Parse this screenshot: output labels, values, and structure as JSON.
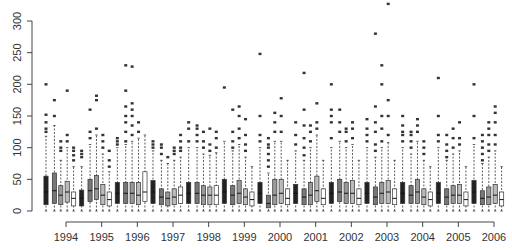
{
  "chart_data": {
    "type": "box",
    "title": "",
    "xlabel": "",
    "ylabel": "",
    "ylim": [
      0,
      330
    ],
    "yticks": [
      0,
      50,
      100,
      150,
      200,
      250,
      300
    ],
    "categories": [
      "1994",
      "1995",
      "1996",
      "1997",
      "1998",
      "1999",
      "2000",
      "2001",
      "2002",
      "2003",
      "2004",
      "2005",
      "2006"
    ],
    "boxes_per_category": 5,
    "groups": [
      {
        "year": "1994",
        "boxes": [
          {
            "q1": 10,
            "median": 30,
            "q3": 55,
            "whisker_low": 0,
            "whisker_high": 118,
            "fill": "#222",
            "outliers": [
              125,
              130,
              140,
              152,
              200
            ]
          },
          {
            "q1": 12,
            "median": 32,
            "q3": 60,
            "whisker_low": 0,
            "whisker_high": 135,
            "fill": "#777",
            "outliers": [
              150,
              175
            ]
          },
          {
            "q1": 10,
            "median": 25,
            "q3": 40,
            "whisker_low": 0,
            "whisker_high": 80,
            "fill": "#999",
            "outliers": [
              95,
              100,
              110
            ]
          },
          {
            "q1": 14,
            "median": 30,
            "q3": 47,
            "whisker_low": 0,
            "whisker_high": 100,
            "fill": "#bbb",
            "outliers": [
              110,
              120,
              190
            ]
          },
          {
            "q1": 8,
            "median": 20,
            "q3": 30,
            "whisker_low": 0,
            "whisker_high": 70,
            "fill": "#fff",
            "outliers": [
              80,
              88,
              95,
              100
            ]
          }
        ]
      },
      {
        "year": "1995",
        "boxes": [
          {
            "q1": 8,
            "median": 20,
            "q3": 33,
            "whisker_low": 0,
            "whisker_high": 70,
            "fill": "#222",
            "outliers": [
              85,
              90,
              95
            ]
          },
          {
            "q1": 15,
            "median": 32,
            "q3": 50,
            "whisker_low": 0,
            "whisker_high": 105,
            "fill": "#777",
            "outliers": [
              115,
              125,
              160
            ]
          },
          {
            "q1": 18,
            "median": 35,
            "q3": 56,
            "whisker_low": 0,
            "whisker_high": 120,
            "fill": "#999",
            "outliers": [
              130,
              175,
              182
            ]
          },
          {
            "q1": 10,
            "median": 25,
            "q3": 42,
            "whisker_low": 0,
            "whisker_high": 90,
            "fill": "#bbb",
            "outliers": [
              100,
              110,
              120
            ]
          },
          {
            "q1": 8,
            "median": 18,
            "q3": 30,
            "whisker_low": 0,
            "whisker_high": 62,
            "fill": "#fff",
            "outliers": [
              70,
              80,
              95
            ]
          }
        ]
      },
      {
        "year": "1996",
        "boxes": [
          {
            "q1": 12,
            "median": 28,
            "q3": 45,
            "whisker_low": 0,
            "whisker_high": 100,
            "fill": "#222",
            "outliers": [
              105,
              110,
              115
            ]
          },
          {
            "q1": 12,
            "median": 28,
            "q3": 45,
            "whisker_low": 0,
            "whisker_high": 105,
            "fill": "#777",
            "outliers": [
              110,
              125,
              140,
              150,
              165,
              190,
              230
            ]
          },
          {
            "q1": 12,
            "median": 28,
            "q3": 45,
            "whisker_low": 0,
            "whisker_high": 110,
            "fill": "#999",
            "outliers": [
              120,
              135,
              150,
              160,
              170,
              228
            ]
          },
          {
            "q1": 10,
            "median": 25,
            "q3": 45,
            "whisker_low": 0,
            "whisker_high": 115,
            "fill": "#bbb",
            "outliers": [
              125,
              140
            ]
          },
          {
            "q1": 15,
            "median": 30,
            "q3": 62,
            "whisker_low": 0,
            "whisker_high": 120,
            "fill": "#fff",
            "outliers": []
          }
        ]
      },
      {
        "year": "1997",
        "boxes": [
          {
            "q1": 12,
            "median": 30,
            "q3": 48,
            "whisker_low": 0,
            "whisker_high": 95,
            "fill": "#222",
            "outliers": [
              100,
              105,
              110
            ]
          },
          {
            "q1": 10,
            "median": 22,
            "q3": 35,
            "whisker_low": 0,
            "whisker_high": 80,
            "fill": "#777",
            "outliers": [
              90,
              100,
              105
            ]
          },
          {
            "q1": 8,
            "median": 20,
            "q3": 30,
            "whisker_low": 0,
            "whisker_high": 75,
            "fill": "#999",
            "outliers": [
              85
            ]
          },
          {
            "q1": 10,
            "median": 22,
            "q3": 35,
            "whisker_low": 0,
            "whisker_high": 80,
            "fill": "#bbb",
            "outliers": [
              90,
              95,
              100
            ]
          },
          {
            "q1": 12,
            "median": 25,
            "q3": 38,
            "whisker_low": 0,
            "whisker_high": 85,
            "fill": "#fff",
            "outliers": [
              95,
              100,
              110,
              120
            ]
          }
        ]
      },
      {
        "year": "1998",
        "boxes": [
          {
            "q1": 12,
            "median": 28,
            "q3": 45,
            "whisker_low": 0,
            "whisker_high": 100,
            "fill": "#222",
            "outliers": [
              110,
              130,
              140
            ]
          },
          {
            "q1": 12,
            "median": 28,
            "q3": 45,
            "whisker_low": 0,
            "whisker_high": 100,
            "fill": "#777",
            "outliers": [
              110,
              120,
              130,
              135
            ]
          },
          {
            "q1": 10,
            "median": 25,
            "q3": 40,
            "whisker_low": 0,
            "whisker_high": 90,
            "fill": "#999",
            "outliers": [
              100,
              110,
              125
            ]
          },
          {
            "q1": 10,
            "median": 25,
            "q3": 38,
            "whisker_low": 0,
            "whisker_high": 88,
            "fill": "#bbb",
            "outliers": [
              95,
              105,
              130
            ]
          },
          {
            "q1": 10,
            "median": 25,
            "q3": 40,
            "whisker_low": 0,
            "whisker_high": 92,
            "fill": "#fff",
            "outliers": [
              100,
              115,
              125
            ]
          }
        ]
      },
      {
        "year": "1999",
        "boxes": [
          {
            "q1": 12,
            "median": 30,
            "q3": 50,
            "whisker_low": 0,
            "whisker_high": 110,
            "fill": "#222",
            "outliers": [
              195
            ]
          },
          {
            "q1": 10,
            "median": 25,
            "q3": 40,
            "whisker_low": 0,
            "whisker_high": 95,
            "fill": "#777",
            "outliers": [
              100,
              110,
              125,
              160
            ]
          },
          {
            "q1": 12,
            "median": 28,
            "q3": 48,
            "whisker_low": 0,
            "whisker_high": 105,
            "fill": "#999",
            "outliers": [
              115,
              130,
              150,
              165
            ]
          },
          {
            "q1": 10,
            "median": 22,
            "q3": 35,
            "whisker_low": 0,
            "whisker_high": 85,
            "fill": "#bbb",
            "outliers": [
              95,
              105,
              120,
              145
            ]
          },
          {
            "q1": 8,
            "median": 18,
            "q3": 30,
            "whisker_low": 0,
            "whisker_high": 70,
            "fill": "#fff",
            "outliers": []
          }
        ]
      },
      {
        "year": "2000",
        "boxes": [
          {
            "q1": 12,
            "median": 28,
            "q3": 45,
            "whisker_low": 0,
            "whisker_high": 100,
            "fill": "#222",
            "outliers": [
              110,
              120,
              150,
              248
            ]
          },
          {
            "q1": 5,
            "median": 12,
            "q3": 25,
            "whisker_low": 0,
            "whisker_high": 60,
            "fill": "#777",
            "outliers": [
              70,
              80,
              90,
              100,
              105,
              115
            ]
          },
          {
            "q1": 10,
            "median": 25,
            "q3": 50,
            "whisker_low": 0,
            "whisker_high": 110,
            "fill": "#999",
            "outliers": [
              125,
              140,
              155
            ]
          },
          {
            "q1": 12,
            "median": 28,
            "q3": 50,
            "whisker_low": 0,
            "whisker_high": 110,
            "fill": "#bbb",
            "outliers": [
              125,
              150,
              178
            ]
          },
          {
            "q1": 10,
            "median": 20,
            "q3": 35,
            "whisker_low": 0,
            "whisker_high": 80,
            "fill": "#fff",
            "outliers": []
          }
        ]
      },
      {
        "year": "2001",
        "boxes": [
          {
            "q1": 12,
            "median": 28,
            "q3": 42,
            "whisker_low": 0,
            "whisker_high": 95,
            "fill": "#222",
            "outliers": [
              105,
              120,
              140
            ]
          },
          {
            "q1": 10,
            "median": 22,
            "q3": 35,
            "whisker_low": 0,
            "whisker_high": 80,
            "fill": "#777",
            "outliers": [
              88,
              100,
              115,
              135,
              160,
              218
            ]
          },
          {
            "q1": 10,
            "median": 25,
            "q3": 45,
            "whisker_low": 0,
            "whisker_high": 100,
            "fill": "#999",
            "outliers": [
              110,
              125,
              135
            ]
          },
          {
            "q1": 15,
            "median": 32,
            "q3": 55,
            "whisker_low": 0,
            "whisker_high": 120,
            "fill": "#bbb",
            "outliers": [
              130,
              140,
              170
            ]
          },
          {
            "q1": 10,
            "median": 20,
            "q3": 35,
            "whisker_low": 0,
            "whisker_high": 80,
            "fill": "#fff",
            "outliers": []
          }
        ]
      },
      {
        "year": "2002",
        "boxes": [
          {
            "q1": 12,
            "median": 28,
            "q3": 45,
            "whisker_low": 0,
            "whisker_high": 100,
            "fill": "#222",
            "outliers": [
              115,
              140,
              150,
              160,
              200
            ]
          },
          {
            "q1": 15,
            "median": 30,
            "q3": 50,
            "whisker_low": 0,
            "whisker_high": 110,
            "fill": "#777",
            "outliers": [
              125,
              140,
              160
            ]
          },
          {
            "q1": 12,
            "median": 28,
            "q3": 45,
            "whisker_low": 0,
            "whisker_high": 100,
            "fill": "#999",
            "outliers": [
              110,
              125,
              130
            ]
          },
          {
            "q1": 12,
            "median": 28,
            "q3": 48,
            "whisker_low": 0,
            "whisker_high": 105,
            "fill": "#bbb",
            "outliers": [
              115,
              130,
              140
            ]
          },
          {
            "q1": 10,
            "median": 20,
            "q3": 35,
            "whisker_low": 0,
            "whisker_high": 80,
            "fill": "#fff",
            "outliers": []
          }
        ]
      },
      {
        "year": "2003",
        "boxes": [
          {
            "q1": 12,
            "median": 28,
            "q3": 45,
            "whisker_low": 0,
            "whisker_high": 100,
            "fill": "#222",
            "outliers": [
              110,
              120,
              130,
              145
            ]
          },
          {
            "q1": 10,
            "median": 22,
            "q3": 38,
            "whisker_low": 0,
            "whisker_high": 85,
            "fill": "#777",
            "outliers": [
              95,
              105,
              125,
              140,
              165,
              280
            ]
          },
          {
            "q1": 12,
            "median": 28,
            "q3": 45,
            "whisker_low": 0,
            "whisker_high": 100,
            "fill": "#999",
            "outliers": [
              110,
              130,
              150,
              200,
              230
            ]
          },
          {
            "q1": 12,
            "median": 30,
            "q3": 48,
            "whisker_low": 0,
            "whisker_high": 108,
            "fill": "#bbb",
            "outliers": [
              120,
              150,
              175,
              327
            ]
          },
          {
            "q1": 10,
            "median": 20,
            "q3": 35,
            "whisker_low": 0,
            "whisker_high": 80,
            "fill": "#fff",
            "outliers": []
          }
        ]
      },
      {
        "year": "2004",
        "boxes": [
          {
            "q1": 12,
            "median": 28,
            "q3": 45,
            "whisker_low": 0,
            "whisker_high": 100,
            "fill": "#222",
            "outliers": [
              110,
              120,
              125,
              135,
              150
            ]
          },
          {
            "q1": 12,
            "median": 25,
            "q3": 40,
            "whisker_low": 0,
            "whisker_high": 90,
            "fill": "#777",
            "outliers": [
              100,
              110,
              120,
              125
            ]
          },
          {
            "q1": 12,
            "median": 30,
            "q3": 50,
            "whisker_low": 0,
            "whisker_high": 110,
            "fill": "#999",
            "outliers": [
              125,
              135,
              145
            ]
          },
          {
            "q1": 10,
            "median": 22,
            "q3": 35,
            "whisker_low": 0,
            "whisker_high": 80,
            "fill": "#bbb",
            "outliers": [
              90,
              100,
              110
            ]
          },
          {
            "q1": 8,
            "median": 18,
            "q3": 30,
            "whisker_low": 0,
            "whisker_high": 70,
            "fill": "#fff",
            "outliers": []
          }
        ]
      },
      {
        "year": "2005",
        "boxes": [
          {
            "q1": 12,
            "median": 28,
            "q3": 45,
            "whisker_low": 0,
            "whisker_high": 100,
            "fill": "#222",
            "outliers": [
              110,
              120,
              150,
              210
            ]
          },
          {
            "q1": 10,
            "median": 22,
            "q3": 35,
            "whisker_low": 0,
            "whisker_high": 80,
            "fill": "#777",
            "outliers": [
              85,
              95,
              105,
              120
            ]
          },
          {
            "q1": 12,
            "median": 25,
            "q3": 40,
            "whisker_low": 0,
            "whisker_high": 90,
            "fill": "#999",
            "outliers": [
              100,
              115,
              130
            ]
          },
          {
            "q1": 12,
            "median": 25,
            "q3": 42,
            "whisker_low": 0,
            "whisker_high": 95,
            "fill": "#bbb",
            "outliers": [
              105,
              115,
              140
            ]
          },
          {
            "q1": 8,
            "median": 18,
            "q3": 30,
            "whisker_low": 0,
            "whisker_high": 70,
            "fill": "#fff",
            "outliers": []
          }
        ]
      },
      {
        "year": "2006",
        "boxes": [
          {
            "q1": 12,
            "median": 30,
            "q3": 48,
            "whisker_low": 0,
            "whisker_high": 105,
            "fill": "#222",
            "outliers": [
              115,
              150,
              200
            ]
          },
          {
            "q1": 10,
            "median": 20,
            "q3": 32,
            "whisker_low": 0,
            "whisker_high": 75,
            "fill": "#777",
            "outliers": [
              80,
              90,
              100,
              110,
              120
            ]
          },
          {
            "q1": 10,
            "median": 22,
            "q3": 38,
            "whisker_low": 0,
            "whisker_high": 85,
            "fill": "#999",
            "outliers": [
              95,
              105,
              120,
              130,
              140
            ]
          },
          {
            "q1": 12,
            "median": 25,
            "q3": 42,
            "whisker_low": 0,
            "whisker_high": 95,
            "fill": "#bbb",
            "outliers": [
              105,
              120,
              140,
              155,
              165
            ]
          },
          {
            "q1": 8,
            "median": 18,
            "q3": 30,
            "whisker_low": 0,
            "whisker_high": 70,
            "fill": "#fff",
            "outliers": []
          }
        ]
      }
    ],
    "grid": false,
    "legend": null
  }
}
